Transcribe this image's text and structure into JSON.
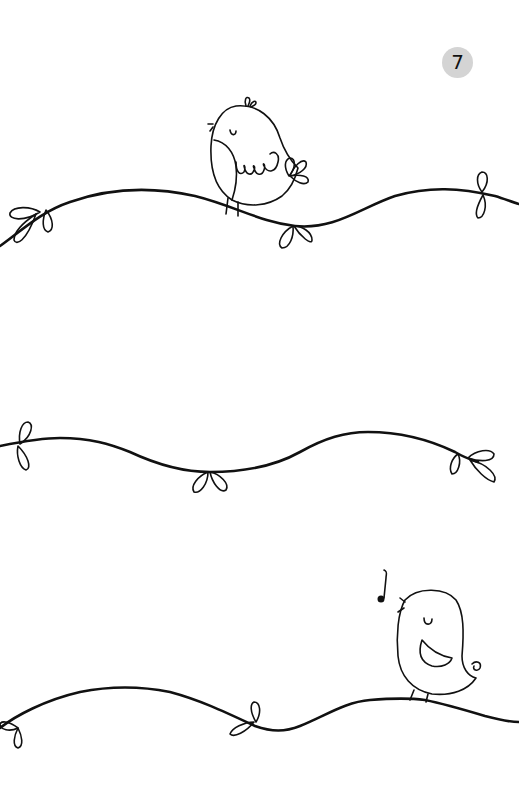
{
  "page": {
    "number": "7",
    "badge_color": "#d4d4d4",
    "line_color": "#111111",
    "background": "#ffffff"
  },
  "illustrations": [
    {
      "id": "bird-sleeping",
      "description": "bird with closed eye perched on top vine"
    },
    {
      "id": "vine-top",
      "description": "wavy vine with leaf pairs"
    },
    {
      "id": "vine-middle",
      "description": "wavy vine with leaf pairs"
    },
    {
      "id": "bird-singing",
      "description": "singing bird with music note on bottom vine"
    },
    {
      "id": "vine-bottom",
      "description": "wavy vine with leaf pairs"
    }
  ]
}
